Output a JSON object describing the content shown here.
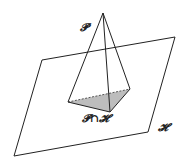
{
  "diagram": {
    "labels": {
      "pyramid": "𝓟",
      "intersection": "𝓟∩𝓗",
      "plane": "𝓗"
    },
    "colors": {
      "stroke": "#222222",
      "shade": "#bdbdbd"
    }
  }
}
